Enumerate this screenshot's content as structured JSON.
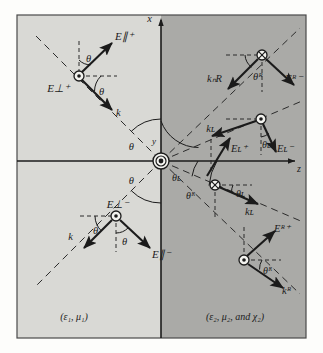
{
  "figure": {
    "type": "physics-ray-diagram",
    "title_hidden": "",
    "axes": {
      "vertical_label": "x",
      "horizontal_label": "z",
      "origin_label": "y"
    },
    "media": {
      "left_label": "(ε₁, μ₁)",
      "right_label": "(ε₂, μ₂, and χ₂)"
    },
    "colors": {
      "left_medium": "#d8d8d4",
      "right_medium": "#a9a9a6",
      "ink": "#1b1b1b",
      "frame": "#3a3a3a",
      "page": "#fdfdfb"
    },
    "quadrants": {
      "upper_left": {
        "name": "incident-wave",
        "marker": "circle-dot",
        "vectors": [
          {
            "name": "E-parallel-plus",
            "label": "E∥⁺"
          },
          {
            "name": "E-perp-plus",
            "label": "E⊥⁺"
          },
          {
            "name": "wavevector-k",
            "label": "k"
          }
        ],
        "angles": [
          {
            "name": "theta-upper",
            "label": "θ"
          },
          {
            "name": "theta-lower",
            "label": "θ"
          }
        ]
      },
      "lower_left": {
        "name": "reflected-wave",
        "marker": "circle-dot",
        "vectors": [
          {
            "name": "E-perp-minus",
            "label": "E⊥⁻"
          },
          {
            "name": "E-parallel-minus",
            "label": "E∥⁻"
          },
          {
            "name": "wavevector-k",
            "label": "k"
          }
        ],
        "angles": [
          {
            "name": "theta-left",
            "label": "θ"
          },
          {
            "name": "theta-right",
            "label": "θ"
          }
        ]
      },
      "upper_right_outer": {
        "name": "right-circular-transmitted-upper",
        "marker": "circle-cross",
        "vectors": [
          {
            "name": "wavevector-kR",
            "label": "kₙR"
          },
          {
            "name": "E-R-minus",
            "label": "Eᴿ⁻"
          }
        ],
        "angles": [
          {
            "name": "theta-R",
            "label": "θᴿ"
          }
        ]
      },
      "upper_right_inner": {
        "name": "left-circular-transmitted-upper",
        "marker": "circle-dot",
        "vectors": [
          {
            "name": "wavevector-kL",
            "label": "kʟ"
          },
          {
            "name": "E-L-minus",
            "label": "Eʟ⁻"
          },
          {
            "name": "E-L-plus",
            "label": "Eʟ⁺"
          }
        ],
        "angles": [
          {
            "name": "theta-L",
            "label": "θʟ"
          }
        ]
      },
      "lower_right_inner": {
        "name": "left-circular-transmitted-lower",
        "marker": "circle-cross",
        "vectors": [
          {
            "name": "wavevector-kL",
            "label": "kʟ"
          }
        ],
        "angles": [
          {
            "name": "theta-L",
            "label": "θʟ"
          }
        ]
      },
      "lower_right_outer": {
        "name": "right-circular-transmitted-lower",
        "marker": "circle-dot",
        "vectors": [
          {
            "name": "E-R-plus",
            "label": "Eᴿ⁺"
          },
          {
            "name": "wavevector-kR",
            "label": "kᴿ"
          }
        ],
        "angles": [
          {
            "name": "theta-R",
            "label": "θᴿ"
          }
        ]
      }
    },
    "origin_arcs": [
      {
        "name": "theta-incident-arc",
        "label": "θ"
      },
      {
        "name": "theta-reflected-arc",
        "label": "θ"
      },
      {
        "name": "theta-L-arc",
        "label": "θʟ"
      },
      {
        "name": "theta-R-arc",
        "label": "θᴿ"
      }
    ]
  }
}
